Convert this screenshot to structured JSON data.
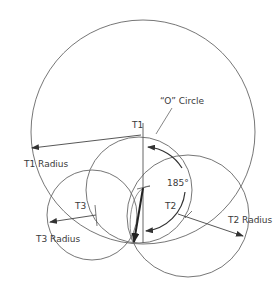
{
  "diagram": {
    "type": "geometric-construction",
    "labels": {
      "o_circle": "“O” Circle",
      "t1": "T1",
      "t1_radius": "T1 Radius",
      "angle": "185°",
      "t2": "T2",
      "t2_radius": "T2 Radius",
      "t3": "T3",
      "t3_radius": "T3 Radius"
    },
    "circles": [
      {
        "name": "T1 circle",
        "cx": 143,
        "cy": 132,
        "r": 112
      },
      {
        "name": "O circle",
        "cx": 139,
        "cy": 190,
        "r": 53
      },
      {
        "name": "T2 circle",
        "cx": 188,
        "cy": 216,
        "r": 61
      },
      {
        "name": "T3 circle",
        "cx": 92,
        "cy": 215,
        "r": 45
      }
    ],
    "angle_value": "185°",
    "colors": {
      "stroke": "#555555",
      "text": "#3a3a3a",
      "background": "#ffffff"
    }
  }
}
